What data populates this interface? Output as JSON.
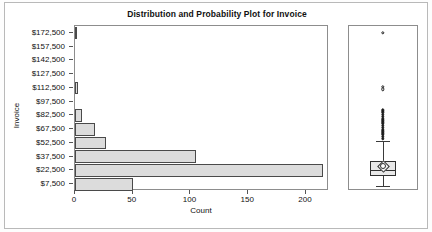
{
  "title": "Distribution and Probability Plot for Invoice",
  "axes": {
    "ylabel": "Invoice",
    "xlabel": "Count",
    "yticks": [
      "$172,500",
      "$157,500",
      "$142,500",
      "$127,500",
      "$112,500",
      "$97,500",
      "$82,500",
      "$67,500",
      "$52,500",
      "$37,500",
      "$22,500",
      "$7,500"
    ],
    "xticks": [
      "0",
      "50",
      "100",
      "150",
      "200"
    ]
  },
  "colors": {
    "bar_fill": "#dcdcdc",
    "bar_edge": "#4a4a4a",
    "frame": "#8d8d8d",
    "text": "#111111"
  },
  "chart_data": {
    "type": "bar",
    "title": "Distribution and Probability Plot for Invoice",
    "xlabel": "Count",
    "ylabel": "Invoice",
    "orientation": "horizontal",
    "categories": [
      "$172,500",
      "$157,500",
      "$142,500",
      "$127,500",
      "$112,500",
      "$97,500",
      "$82,500",
      "$67,500",
      "$52,500",
      "$37,500",
      "$22,500",
      "$7,500"
    ],
    "values": [
      1,
      0,
      0,
      0,
      3,
      0,
      6,
      17,
      27,
      105,
      215,
      50
    ],
    "xlim": [
      0,
      215
    ],
    "ylim_labels": [
      "$7,500",
      "$172,500"
    ],
    "bin_width": 15000,
    "grid": false,
    "legend": null,
    "boxplot": {
      "orientation": "vertical",
      "whisker_low": 5000,
      "q1": 16000,
      "median": 23000,
      "mean": 27000,
      "q3": 33000,
      "whisker_high": 55000,
      "outliers": [
        172500,
        114000,
        111000,
        88000,
        86000,
        83000,
        81000,
        79000,
        77000,
        75000,
        73000,
        71000,
        69000,
        67000,
        65000,
        63000,
        61000,
        59000,
        57000
      ],
      "mean_marker": "diamond"
    }
  }
}
